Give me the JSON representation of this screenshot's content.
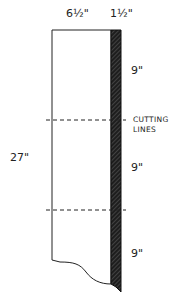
{
  "diagram": {
    "width_labels": {
      "main": "6½\"",
      "strip": "1½\""
    },
    "height_label": "27\"",
    "segment_labels": [
      "9\"",
      "9\"",
      "9\""
    ],
    "cutting_label": [
      "CUTTING",
      "LINES"
    ],
    "colors": {
      "stroke": "#222222",
      "strip": "#2a2a2a",
      "background": "#ffffff"
    }
  }
}
